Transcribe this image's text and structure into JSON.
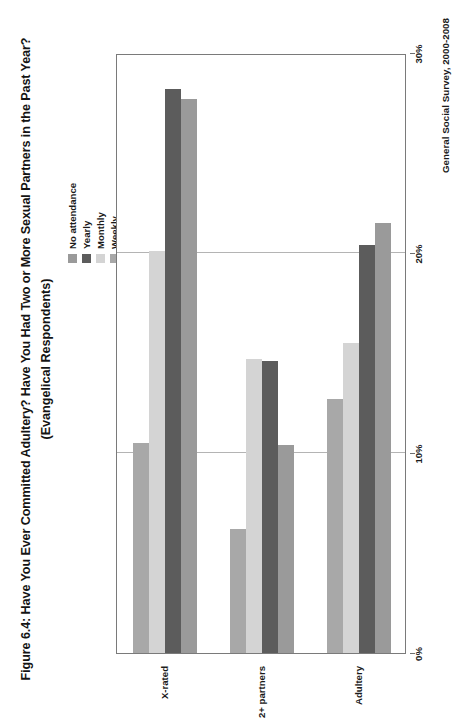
{
  "figure": {
    "title_line1": "Figure 6.4: Have You Ever Committed Adultery?  Have You Had Two or More Sexual Partners in the Past Year?",
    "title_line2": "(Evangelical Respondents)",
    "source_note": "General Social Survey, 2000-2008"
  },
  "legend": {
    "items": [
      {
        "label": "No attendance",
        "color": "#9a9a9a"
      },
      {
        "label": "Yearly",
        "color": "#5c5c5c"
      },
      {
        "label": "Monthly",
        "color": "#d4d4d4"
      },
      {
        "label": "Weekly",
        "color": "#a8a8a8"
      }
    ]
  },
  "chart_data": {
    "type": "bar",
    "orientation": "horizontal",
    "title": "Figure 6.4: Have You Ever Committed Adultery?  Have You Had Two or More Sexual Partners in the Past Year? (Evangelical Respondents)",
    "xlabel": "",
    "ylabel": "",
    "categories": [
      "Adultery",
      "2+ partners",
      "X-rated"
    ],
    "series": [
      {
        "name": "No attendance",
        "color": "#9a9a9a",
        "values": [
          21.5,
          10.4,
          27.7
        ]
      },
      {
        "name": "Yearly",
        "color": "#5c5c5c",
        "values": [
          20.4,
          14.6,
          28.2
        ]
      },
      {
        "name": "Monthly",
        "color": "#d4d4d4",
        "values": [
          15.5,
          14.7,
          20.1
        ]
      },
      {
        "name": "Weekly",
        "color": "#a8a8a8",
        "values": [
          12.7,
          6.2,
          10.5
        ]
      }
    ],
    "value_axis": {
      "min": 0,
      "max": 30,
      "ticks": [
        0,
        10,
        20,
        30
      ],
      "ticklabels": [
        "0%",
        "10%",
        "20%",
        "30%"
      ],
      "grid": true
    },
    "legend_position": "top-right",
    "source": "General Social Survey, 2000-2008"
  }
}
